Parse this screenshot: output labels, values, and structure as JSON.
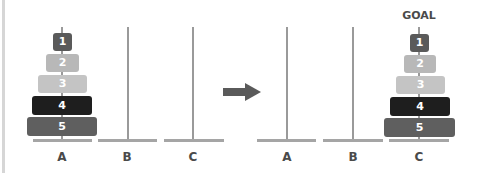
{
  "diagram": {
    "goal_label": "GOAL",
    "colors": {
      "disk_1": "#5a5a5a",
      "disk_2": "#b8b8b8",
      "disk_3": "#c4c4c4",
      "disk_4": "#1e1e1e",
      "disk_5": "#5f5f5f",
      "pole": "#9a9a9a",
      "arrow": "#5a5a5a",
      "label": "#4a4a4a"
    },
    "start_state": {
      "pegs": [
        {
          "label": "A",
          "disks": [
            "1",
            "2",
            "3",
            "4",
            "5"
          ]
        },
        {
          "label": "B",
          "disks": []
        },
        {
          "label": "C",
          "disks": []
        }
      ]
    },
    "arrow": "arrow-right-icon",
    "goal_state": {
      "pegs": [
        {
          "label": "A",
          "disks": []
        },
        {
          "label": "B",
          "disks": []
        },
        {
          "label": "C",
          "disks": [
            "1",
            "2",
            "3",
            "4",
            "5"
          ]
        }
      ]
    }
  }
}
